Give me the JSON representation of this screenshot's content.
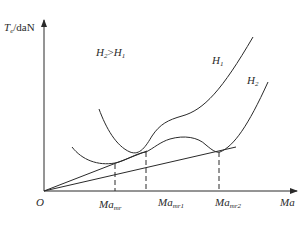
{
  "diagram": {
    "y_axis_label": {
      "var": "T",
      "sub": "e",
      "unit": "/daN"
    },
    "x_axis_label": "Ma",
    "origin_label": "O",
    "condition": {
      "left": "H",
      "left_sub": "2",
      "op": ">",
      "right": "H",
      "right_sub": "1"
    },
    "curves": [
      {
        "name": "H",
        "sub": "1"
      },
      {
        "name": "H",
        "sub": "2"
      }
    ],
    "x_markers": [
      {
        "name": "Ma",
        "sub": "mr"
      },
      {
        "name": "Ma",
        "sub": "mr1"
      },
      {
        "name": "Ma",
        "sub": "mr2"
      }
    ],
    "colors": {
      "line": "#2a2a2a",
      "background": "#ffffff"
    }
  }
}
